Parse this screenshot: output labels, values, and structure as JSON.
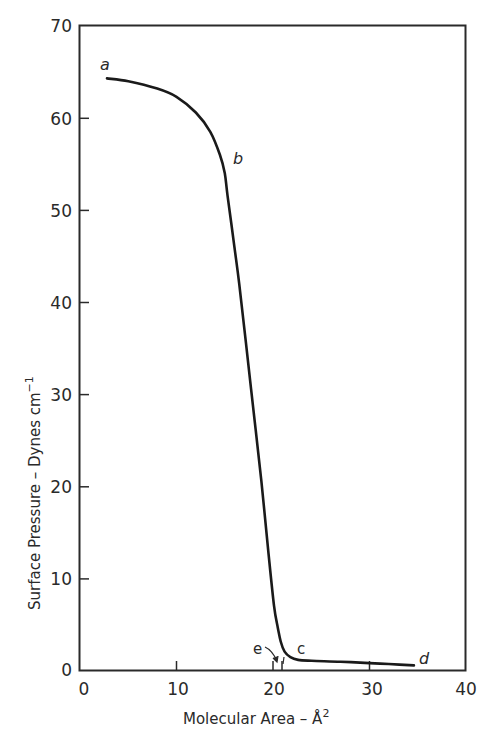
{
  "chart_data": {
    "type": "line",
    "title": "",
    "xlabel": "Molecular Area – Å²",
    "ylabel": "Surface Pressure – Dynes cm⁻¹",
    "xlim": [
      0,
      40
    ],
    "ylim": [
      0,
      70
    ],
    "x_ticks": [
      0,
      10,
      20,
      30,
      40
    ],
    "y_ticks": [
      0,
      10,
      20,
      30,
      40,
      50,
      60,
      70
    ],
    "grid": false,
    "legend": null,
    "series": [
      {
        "name": "isotherm",
        "x": [
          2.8,
          5,
          8,
          10,
          12,
          13.5,
          14.5,
          15.0,
          15.3,
          16.0,
          16.5,
          17.2,
          18.0,
          18.8,
          19.5,
          20.1,
          20.5,
          20.8,
          21.2,
          21.8,
          22.6,
          24,
          27,
          30,
          32,
          34.6
        ],
        "y": [
          64.3,
          64.0,
          63.2,
          62.3,
          60.6,
          58.5,
          56.0,
          54.0,
          51.5,
          46.0,
          42.0,
          35.5,
          28.0,
          20.5,
          13.0,
          7.0,
          4.6,
          3.1,
          2.0,
          1.4,
          1.1,
          1.0,
          0.9,
          0.75,
          0.65,
          0.5
        ]
      }
    ],
    "annotations": [
      {
        "label": "a",
        "x": 2.5,
        "y": 65.5,
        "style": "italic"
      },
      {
        "label": "b",
        "x": 15.8,
        "y": 54.5,
        "style": "italic"
      },
      {
        "label": "c",
        "x": 22.0,
        "y": 1.9,
        "style": "upright"
      },
      {
        "label": "d",
        "x": 35.2,
        "y": 0.9,
        "style": "italic"
      },
      {
        "label": "e",
        "x": 18.5,
        "y": 2.2,
        "style": "upright",
        "arrow_to": [
          20.4,
          0.6
        ],
        "marks_x": [
          20.0,
          20.9
        ]
      }
    ]
  },
  "labels": {
    "x_axis": "Molecular Area – Å",
    "x_axis_sup": "2",
    "y_axis": "Surface Pressure – Dynes cm",
    "y_axis_sup": "−1",
    "x_ticks": [
      "0",
      "10",
      "20",
      "30",
      "40"
    ],
    "y_ticks": [
      "0",
      "10",
      "20",
      "30",
      "40",
      "50",
      "60",
      "70"
    ],
    "point_a": "a",
    "point_b": "b",
    "point_c": "c",
    "point_d": "d",
    "point_e": "e"
  }
}
